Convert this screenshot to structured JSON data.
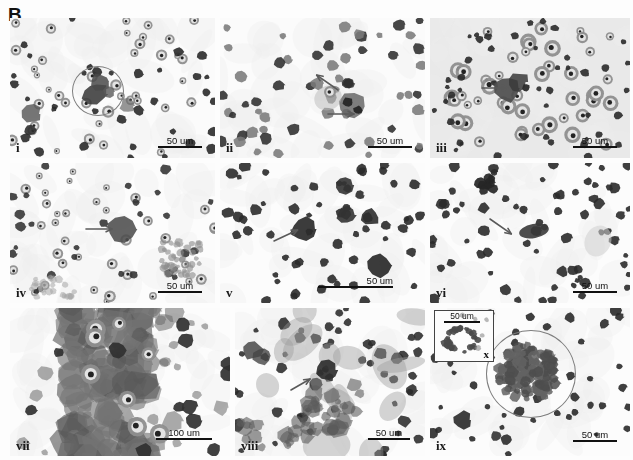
{
  "figure": {
    "panel_letter": "B",
    "width": 633,
    "height": 460,
    "background": "#fdfdfd"
  },
  "colors": {
    "cell_dark": "#2a2a2a",
    "cell_mid": "#6a6a6a",
    "cell_light": "#b4b4b4",
    "background_light": "#fbfbfb",
    "background_gray": "#e9e9e9",
    "annotation_circle": "#7d7d7d",
    "arrow": "#555555",
    "text": "#111111"
  },
  "panels": [
    {
      "id": "i",
      "label": "i",
      "row": 0,
      "col": 0,
      "x": 0,
      "y": 0,
      "w": 205,
      "h": 140,
      "background": "#fbfbfb",
      "scale_bar": {
        "label": "50 um",
        "style": "text-over-line",
        "x": 148,
        "y": 118,
        "line_width": 44
      },
      "annotations": [
        {
          "type": "circle",
          "x": 62,
          "y": 48,
          "w": 50,
          "h": 48
        }
      ],
      "arrows": []
    },
    {
      "id": "ii",
      "label": "ii",
      "row": 0,
      "col": 1,
      "x": 210,
      "y": 0,
      "w": 205,
      "h": 140,
      "background": "#fbfbfb",
      "scale_bar": {
        "label": "50 um",
        "style": "text-over-line",
        "x": 148,
        "y": 118,
        "line_width": 44
      },
      "annotations": [],
      "arrows": [
        {
          "x": 108,
          "y": 96,
          "angle": 0,
          "length": 26
        },
        {
          "x": 118,
          "y": 72,
          "angle": 215,
          "length": 26
        }
      ]
    },
    {
      "id": "iii",
      "label": "iii",
      "row": 0,
      "col": 2,
      "x": 420,
      "y": 0,
      "w": 200,
      "h": 140,
      "background": "#e9e9e9",
      "scale_bar": {
        "label": "50 um",
        "style": "text-over-line",
        "x": 143,
        "y": 118,
        "line_width": 44
      },
      "annotations": [],
      "arrows": [
        {
          "x": 52,
          "y": 70,
          "angle": 0,
          "length": 26
        }
      ]
    },
    {
      "id": "iv",
      "label": "iv",
      "row": 1,
      "col": 0,
      "x": 0,
      "y": 145,
      "w": 205,
      "h": 140,
      "background": "#fcfcfc",
      "scale_bar": {
        "label": "50 um",
        "style": "text-over-line",
        "x": 148,
        "y": 118,
        "line_width": 44
      },
      "annotations": [],
      "arrows": [
        {
          "x": 76,
          "y": 66,
          "angle": 0,
          "length": 26
        }
      ]
    },
    {
      "id": "v",
      "label": "v",
      "row": 1,
      "col": 1,
      "x": 210,
      "y": 145,
      "w": 205,
      "h": 140,
      "background": "#fcfcfc",
      "scale_bar": {
        "label": "50 um",
        "style": "long-line-overlap",
        "x": 98,
        "y": 112,
        "line_width": 75
      },
      "annotations": [],
      "arrows": [
        {
          "x": 54,
          "y": 78,
          "angle": 335,
          "length": 26
        }
      ]
    },
    {
      "id": "vi",
      "label": "vi",
      "row": 1,
      "col": 2,
      "x": 420,
      "y": 145,
      "w": 200,
      "h": 140,
      "background": "#fcfcfc",
      "scale_bar": {
        "label": "50 um",
        "style": "text-over-line",
        "x": 143,
        "y": 118,
        "line_width": 44
      },
      "annotations": [],
      "arrows": [
        {
          "x": 60,
          "y": 56,
          "angle": 35,
          "length": 26
        }
      ]
    },
    {
      "id": "vii",
      "label": "vii",
      "row": 2,
      "col": 0,
      "x": 0,
      "y": 290,
      "w": 220,
      "h": 148,
      "background": "#fcfcfc",
      "scale_bar": {
        "label": "100 um",
        "style": "text-over-line",
        "x": 146,
        "y": 120,
        "line_width": 56
      },
      "annotations": [],
      "arrows": []
    },
    {
      "id": "viii",
      "label": "viii",
      "row": 2,
      "col": 1,
      "x": 225,
      "y": 290,
      "w": 190,
      "h": 148,
      "background": "#fcfcfc",
      "scale_bar": {
        "label": "50 um",
        "style": "text-over-line",
        "x": 133,
        "y": 120,
        "line_width": 42
      },
      "annotations": [],
      "arrows": [
        {
          "x": 56,
          "y": 82,
          "angle": 330,
          "length": 22
        }
      ]
    },
    {
      "id": "ix",
      "label": "ix",
      "row": 2,
      "col": 2,
      "x": 420,
      "y": 290,
      "w": 200,
      "h": 148,
      "background": "#fcfcfc",
      "scale_bar": {
        "label": "50 um",
        "style": "text-over-line",
        "x": 143,
        "y": 122,
        "line_width": 44
      },
      "annotations": [
        {
          "type": "circle",
          "x": 56,
          "y": 22,
          "w": 88,
          "h": 86
        }
      ],
      "arrows": []
    }
  ],
  "inset": {
    "id": "x",
    "label": "x",
    "parent_panel": "ix",
    "x": 4,
    "y": 2,
    "w": 58,
    "h": 50,
    "scale_bar": {
      "label": "50 um"
    }
  }
}
